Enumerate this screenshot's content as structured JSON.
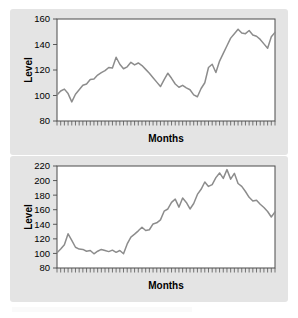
{
  "figure": {
    "background_color": "#ffffff",
    "panel_color": "#e4e4e4",
    "plot_area_color": "#ffffff",
    "line_color": "#8c8c8c",
    "axis_color": "#4a4a4a",
    "text_color": "#000000"
  },
  "charts": [
    {
      "id": "chart-top",
      "ylabel": "Level",
      "xlabel": "Months",
      "yticks": [
        "80",
        "100",
        "120",
        "140",
        "160"
      ]
    },
    {
      "id": "chart-bottom",
      "ylabel": "Level",
      "xlabel": "Months",
      "yticks": [
        "80",
        "100",
        "120",
        "140",
        "160",
        "180",
        "200",
        "220"
      ]
    }
  ],
  "chart_data": [
    {
      "type": "line",
      "title": "",
      "xlabel": "Months",
      "ylabel": "Level",
      "xlim": [
        0,
        59
      ],
      "ylim": [
        80,
        160
      ],
      "grid": false,
      "legend": null,
      "xtick_labels": [],
      "ytick_values": [
        80,
        100,
        120,
        140,
        160
      ],
      "ytick_labels": [
        "80",
        "100",
        "120",
        "140",
        "160"
      ],
      "x": [
        0,
        1,
        2,
        3,
        4,
        5,
        6,
        7,
        8,
        9,
        10,
        11,
        12,
        13,
        14,
        15,
        16,
        17,
        18,
        19,
        20,
        21,
        22,
        23,
        24,
        25,
        26,
        27,
        28,
        29,
        30,
        31,
        32,
        33,
        34,
        35,
        36,
        37,
        38,
        39,
        40,
        41,
        42,
        43,
        44,
        45,
        46,
        47,
        48,
        49,
        50,
        51,
        52,
        53,
        54,
        55,
        56,
        57,
        58,
        59
      ],
      "series": [
        {
          "name": "Level",
          "color": "#8c8c8c",
          "values": [
            100.5,
            103.5,
            105.0,
            101.5,
            95.0,
            101.0,
            104.5,
            108.0,
            109.0,
            112.5,
            113.0,
            116.0,
            118.0,
            119.5,
            122.0,
            121.5,
            130.0,
            124.5,
            121.0,
            122.5,
            126.0,
            124.0,
            125.5,
            123.5,
            120.5,
            117.5,
            114.0,
            110.5,
            107.0,
            112.5,
            117.5,
            113.5,
            109.0,
            106.5,
            108.0,
            106.0,
            104.5,
            100.5,
            99.0,
            105.5,
            110.0,
            122.0,
            124.5,
            118.0,
            127.0,
            133.0,
            139.0,
            145.0,
            148.5,
            152.0,
            149.0,
            148.5,
            151.0,
            147.5,
            146.5,
            144.0,
            140.5,
            137.0,
            146.0,
            149.5
          ]
        }
      ]
    },
    {
      "type": "line",
      "title": "",
      "xlabel": "Months",
      "ylabel": "Level",
      "xlim": [
        0,
        59
      ],
      "ylim": [
        80,
        220
      ],
      "grid": false,
      "legend": null,
      "xtick_labels": [],
      "ytick_values": [
        80,
        100,
        120,
        140,
        160,
        180,
        200,
        220
      ],
      "ytick_labels": [
        "80",
        "100",
        "120",
        "140",
        "160",
        "180",
        "200",
        "220"
      ],
      "x": [
        0,
        1,
        2,
        3,
        4,
        5,
        6,
        7,
        8,
        9,
        10,
        11,
        12,
        13,
        14,
        15,
        16,
        17,
        18,
        19,
        20,
        21,
        22,
        23,
        24,
        25,
        26,
        27,
        28,
        29,
        30,
        31,
        32,
        33,
        34,
        35,
        36,
        37,
        38,
        39,
        40,
        41,
        42,
        43,
        44,
        45,
        46,
        47,
        48,
        49,
        50,
        51,
        52,
        53,
        54,
        55,
        56,
        57,
        58,
        59
      ],
      "series": [
        {
          "name": "Level",
          "color": "#8c8c8c",
          "values": [
            101.0,
            106.0,
            112.0,
            127.0,
            118.0,
            108.5,
            106.0,
            105.5,
            103.0,
            104.0,
            99.5,
            103.0,
            105.5,
            104.0,
            102.5,
            104.5,
            101.5,
            104.0,
            99.5,
            113.0,
            122.5,
            126.5,
            131.0,
            136.0,
            131.5,
            132.5,
            140.5,
            142.0,
            146.0,
            158.0,
            161.0,
            170.0,
            174.5,
            163.5,
            176.0,
            170.0,
            161.0,
            168.5,
            181.0,
            188.0,
            198.0,
            192.0,
            194.5,
            204.0,
            210.5,
            203.0,
            215.0,
            202.0,
            210.0,
            196.0,
            192.0,
            185.0,
            177.0,
            172.0,
            173.0,
            167.5,
            163.0,
            157.5,
            150.0,
            157.0
          ]
        }
      ]
    }
  ]
}
